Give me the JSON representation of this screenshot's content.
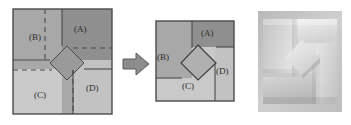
{
  "figure": {
    "panels": [
      {
        "id": "before",
        "name": "unfolded-square-diagram",
        "caption": "",
        "regions": [
          {
            "key": "A",
            "label": "(A)",
            "fill": "#8f8f8f",
            "quadrant": "top-right"
          },
          {
            "key": "B",
            "label": "(B)",
            "fill": "#a8a8a8",
            "quadrant": "top-left"
          },
          {
            "key": "C",
            "label": "(C)",
            "fill": "#c9c9c9",
            "quadrant": "bottom-left"
          },
          {
            "key": "D",
            "label": "(D)",
            "fill": "#c2c2c2",
            "quadrant": "bottom-right"
          }
        ],
        "center_shape": {
          "name": "rotated-square",
          "label": "",
          "fill": "#9a9a9a"
        },
        "line_styles": {
          "solid": "solid fold line",
          "dashed": "dashed crease line"
        }
      },
      {
        "id": "after",
        "name": "folded-square-diagram",
        "caption": "",
        "regions": [
          {
            "key": "A",
            "label": "(A)",
            "fill": "#8f8f8f",
            "quadrant": "top-right"
          },
          {
            "key": "B",
            "label": "(B)",
            "fill": "#a8a8a8",
            "quadrant": "left"
          },
          {
            "key": "C",
            "label": "(C)",
            "fill": "#c9c9c9",
            "quadrant": "bottom"
          },
          {
            "key": "D",
            "label": "(D)",
            "fill": "#c2c2c2",
            "quadrant": "right"
          }
        ],
        "center_shape": {
          "name": "rotated-square",
          "label": "",
          "fill": "#b0b0b0"
        }
      },
      {
        "id": "photo",
        "name": "folded-paper-photograph",
        "caption": ""
      }
    ],
    "arrow": {
      "name": "transformation-arrow",
      "direction": "right",
      "fill": "#8c8c8c"
    },
    "labels": {
      "A": "(A)",
      "B": "(B)",
      "C": "(C)",
      "D": "(D)"
    },
    "colors": {
      "outline": "#4a4a4a",
      "region_a": "#8f8f8f",
      "region_b": "#a8a8a8",
      "region_c": "#c9c9c9",
      "region_d": "#c2c2c2",
      "diamond": "#9a9a9a",
      "arrow": "#8c8c8c",
      "background": "#ffffff",
      "text": "#2b2b2b"
    }
  }
}
